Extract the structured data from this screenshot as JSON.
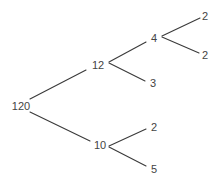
{
  "diagram": {
    "type": "factor-tree",
    "line_color": "#3a3a3a",
    "text_color": "#444444",
    "nodes": [
      {
        "id": "n120",
        "label": "120",
        "x": 21,
        "y": 106
      },
      {
        "id": "n12",
        "label": "12",
        "x": 98,
        "y": 65
      },
      {
        "id": "n10",
        "label": "10",
        "x": 100,
        "y": 145
      },
      {
        "id": "n4",
        "label": "4",
        "x": 154,
        "y": 38
      },
      {
        "id": "n3",
        "label": "3",
        "x": 153,
        "y": 83
      },
      {
        "id": "n2a",
        "label": "2",
        "x": 205,
        "y": 16
      },
      {
        "id": "n2b",
        "label": "2",
        "x": 205,
        "y": 55
      },
      {
        "id": "n2c",
        "label": "2",
        "x": 154,
        "y": 127
      },
      {
        "id": "n5",
        "label": "5",
        "x": 154,
        "y": 169
      }
    ],
    "edges": [
      {
        "from": "n120",
        "to": "n12",
        "x1": 30,
        "y1": 99,
        "x2": 86,
        "y2": 70
      },
      {
        "from": "n120",
        "to": "n10",
        "x1": 30,
        "y1": 112,
        "x2": 90,
        "y2": 141
      },
      {
        "from": "n12",
        "to": "n4",
        "x1": 109,
        "y1": 62,
        "x2": 146,
        "y2": 42
      },
      {
        "from": "n12",
        "to": "n3",
        "x1": 109,
        "y1": 63,
        "x2": 145,
        "y2": 81
      },
      {
        "from": "n4",
        "to": "n2a",
        "x1": 162,
        "y1": 36,
        "x2": 200,
        "y2": 18
      },
      {
        "from": "n4",
        "to": "n2b",
        "x1": 162,
        "y1": 37,
        "x2": 199,
        "y2": 53
      },
      {
        "from": "n10",
        "to": "n2c",
        "x1": 109,
        "y1": 146,
        "x2": 146,
        "y2": 129
      },
      {
        "from": "n10",
        "to": "n5",
        "x1": 109,
        "y1": 147,
        "x2": 146,
        "y2": 166
      }
    ]
  }
}
